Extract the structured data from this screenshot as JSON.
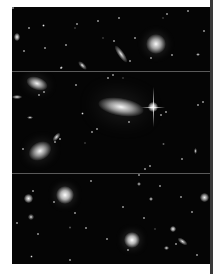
{
  "figure": {
    "panels": [
      {
        "name": "panel-top",
        "top": 0,
        "height": 64,
        "objects": [
          {
            "type": "galaxy-round",
            "x": 134,
            "y": 27,
            "w": 20,
            "h": 20,
            "glow": 0.9
          },
          {
            "type": "galaxy-edge",
            "x": 106,
            "y": 37,
            "w": 6,
            "h": 20,
            "rot": -35,
            "glow": 0.6
          },
          {
            "type": "galaxy-edge",
            "x": 68,
            "y": 53,
            "w": 5,
            "h": 11,
            "rot": -45,
            "glow": 0.5
          },
          {
            "type": "star",
            "x": 2,
            "y": 26,
            "w": 6,
            "h": 8,
            "glow": 0.8
          },
          {
            "type": "star",
            "x": 30,
            "y": 17,
            "w": 3,
            "h": 3,
            "glow": 0.6
          },
          {
            "type": "star",
            "x": 184,
            "y": 46,
            "w": 4,
            "h": 3,
            "glow": 0.6
          },
          {
            "type": "star",
            "x": 48,
            "y": 59,
            "w": 3,
            "h": 3,
            "glow": 0.5
          },
          {
            "type": "star",
            "x": 62,
            "y": 20,
            "w": 2,
            "h": 2,
            "glow": 0.4
          },
          {
            "type": "star",
            "x": 90,
            "y": 30,
            "w": 2,
            "h": 2,
            "glow": 0.4
          },
          {
            "type": "star",
            "x": 150,
            "y": 10,
            "w": 2,
            "h": 2,
            "glow": 0.4
          }
        ]
      },
      {
        "name": "panel-middle",
        "top": 65,
        "height": 101,
        "objects": [
          {
            "type": "galaxy-elliptical",
            "x": 86,
            "y": 26,
            "w": 46,
            "h": 18,
            "rot": 10,
            "glow": 0.85
          },
          {
            "type": "bright-star",
            "x": 136,
            "y": 30,
            "w": 10,
            "h": 10,
            "glow": 1.0,
            "spikes": true
          },
          {
            "type": "galaxy-spiral",
            "x": 14,
            "y": 5,
            "w": 22,
            "h": 13,
            "rot": 20,
            "glow": 0.8
          },
          {
            "type": "galaxy-spiral",
            "x": 16,
            "y": 70,
            "w": 24,
            "h": 18,
            "rot": -30,
            "glow": 0.8
          },
          {
            "type": "galaxy-edge",
            "x": 42,
            "y": 60,
            "w": 5,
            "h": 10,
            "rot": 40,
            "glow": 0.6
          },
          {
            "type": "star",
            "x": 0,
            "y": 23,
            "w": 10,
            "h": 4,
            "glow": 0.6
          },
          {
            "type": "star",
            "x": 69,
            "y": 40,
            "w": 3,
            "h": 3,
            "glow": 0.5
          },
          {
            "type": "star",
            "x": 15,
            "y": 44,
            "w": 6,
            "h": 3,
            "glow": 0.5
          },
          {
            "type": "star",
            "x": 150,
            "y": 71,
            "w": 3,
            "h": 2,
            "glow": 0.5
          },
          {
            "type": "star",
            "x": 182,
            "y": 76,
            "w": 3,
            "h": 6,
            "glow": 0.5
          },
          {
            "type": "star",
            "x": 72,
            "y": 70,
            "w": 2,
            "h": 2,
            "glow": 0.4
          },
          {
            "type": "star",
            "x": 110,
            "y": 5,
            "w": 2,
            "h": 2,
            "glow": 0.4
          }
        ]
      },
      {
        "name": "panel-bottom",
        "top": 167,
        "height": 90,
        "objects": [
          {
            "type": "galaxy-round",
            "x": 44,
            "y": 12,
            "w": 18,
            "h": 18,
            "glow": 1.0
          },
          {
            "type": "galaxy-round",
            "x": 112,
            "y": 58,
            "w": 16,
            "h": 16,
            "glow": 1.0
          },
          {
            "type": "star",
            "x": 12,
            "y": 20,
            "w": 9,
            "h": 9,
            "glow": 0.85
          },
          {
            "type": "star",
            "x": 188,
            "y": 19,
            "w": 9,
            "h": 9,
            "glow": 0.8
          },
          {
            "type": "star",
            "x": 16,
            "y": 40,
            "w": 6,
            "h": 6,
            "glow": 0.5
          },
          {
            "type": "star",
            "x": 158,
            "y": 52,
            "w": 6,
            "h": 6,
            "glow": 0.8
          },
          {
            "type": "galaxy-edge",
            "x": 168,
            "y": 62,
            "w": 5,
            "h": 11,
            "rot": -55,
            "glow": 0.6
          },
          {
            "type": "star",
            "x": 125,
            "y": 8,
            "w": 4,
            "h": 4,
            "glow": 0.5
          },
          {
            "type": "star",
            "x": 137,
            "y": 23,
            "w": 4,
            "h": 4,
            "glow": 0.6
          },
          {
            "type": "star",
            "x": 152,
            "y": 72,
            "w": 5,
            "h": 4,
            "glow": 0.6
          },
          {
            "type": "star",
            "x": 57,
            "y": 52,
            "w": 2,
            "h": 3,
            "glow": 0.4
          },
          {
            "type": "star",
            "x": 18,
            "y": 81,
            "w": 3,
            "h": 3,
            "glow": 0.4
          },
          {
            "type": "star",
            "x": 142,
            "y": 54,
            "w": 2,
            "h": 2,
            "glow": 0.4
          }
        ]
      }
    ],
    "divider_color": "#5a5a5a",
    "background_color": "#050505",
    "rule_color": "#3a3a3a"
  }
}
